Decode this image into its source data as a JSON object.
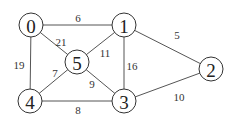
{
  "graph": {
    "nodes": [
      {
        "id": "0",
        "label": "0",
        "x": 31,
        "y": 25
      },
      {
        "id": "1",
        "label": "1",
        "x": 124,
        "y": 25
      },
      {
        "id": "2",
        "label": "2",
        "x": 211,
        "y": 69
      },
      {
        "id": "3",
        "label": "3",
        "x": 124,
        "y": 101
      },
      {
        "id": "4",
        "label": "4",
        "x": 30,
        "y": 101
      },
      {
        "id": "5",
        "label": "5",
        "x": 77,
        "y": 62
      }
    ],
    "edges": [
      {
        "from": "0",
        "to": "1",
        "weight": "6",
        "lx": 78,
        "ly": 18
      },
      {
        "from": "0",
        "to": "5",
        "weight": "21",
        "lx": 61,
        "ly": 42
      },
      {
        "from": "0",
        "to": "4",
        "weight": "19",
        "lx": 19,
        "ly": 65
      },
      {
        "from": "1",
        "to": "5",
        "weight": "11",
        "lx": 105,
        "ly": 53
      },
      {
        "from": "1",
        "to": "3",
        "weight": "16",
        "lx": 132,
        "ly": 66
      },
      {
        "from": "1",
        "to": "2",
        "weight": "5",
        "lx": 177,
        "ly": 35
      },
      {
        "from": "5",
        "to": "4",
        "weight": "7",
        "lx": 55,
        "ly": 73
      },
      {
        "from": "5",
        "to": "3",
        "weight": "9",
        "lx": 92,
        "ly": 84
      },
      {
        "from": "4",
        "to": "3",
        "weight": "8",
        "lx": 78,
        "ly": 110
      },
      {
        "from": "3",
        "to": "2",
        "weight": "10",
        "lx": 179,
        "ly": 97
      }
    ]
  }
}
